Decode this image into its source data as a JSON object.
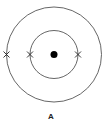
{
  "diagram": {
    "type": "atomic-shell-model",
    "label": "A",
    "colors": {
      "stroke": "#555555",
      "nucleus": "#000000",
      "electron": "#222222",
      "background": "#ffffff"
    },
    "nucleus": {
      "cx": 54,
      "cy": 54.5,
      "r": 3.5
    },
    "shells": [
      {
        "name": "inner-shell",
        "cx": 54,
        "cy": 54.5,
        "r": 24,
        "electrons": 2
      },
      {
        "name": "outer-shell",
        "cx": 54,
        "cy": 54.5,
        "r": 47.5,
        "electrons": 1
      }
    ],
    "electrons": [
      {
        "shell": "outer",
        "x": 6.5,
        "y": 54.5
      },
      {
        "shell": "inner",
        "x": 30,
        "y": 54.5
      },
      {
        "shell": "inner",
        "x": 78,
        "y": 54.5
      }
    ]
  }
}
